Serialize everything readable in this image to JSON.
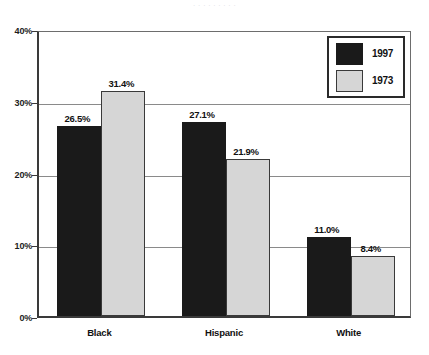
{
  "caption_remnant": ". .  . .  .  .    .   .     .",
  "chart_data": {
    "type": "bar",
    "title": "",
    "subtitle": "",
    "xlabel": "",
    "ylabel": "",
    "categories": [
      "Black",
      "Hispanic",
      "White"
    ],
    "series": [
      {
        "name": "1997",
        "color": "#1a1a1a",
        "values": [
          26.5,
          27.1,
          11.0
        ],
        "labels": [
          "26.5%",
          "27.1%",
          "11.0%"
        ]
      },
      {
        "name": "1973",
        "color": "#d6d6d6",
        "values": [
          31.4,
          21.9,
          8.4
        ],
        "labels": [
          "31.4%",
          "21.9%",
          "8.4%"
        ]
      }
    ],
    "ylim": [
      0,
      40
    ],
    "ytick_values": [
      0,
      10,
      20,
      30,
      40
    ],
    "ytick_labels": [
      "0%",
      "10%",
      "20%",
      "30%",
      "40%"
    ],
    "grid": true,
    "grid_axis": "y",
    "legend_position": "top-right",
    "value_labels": true,
    "units": "percent"
  }
}
